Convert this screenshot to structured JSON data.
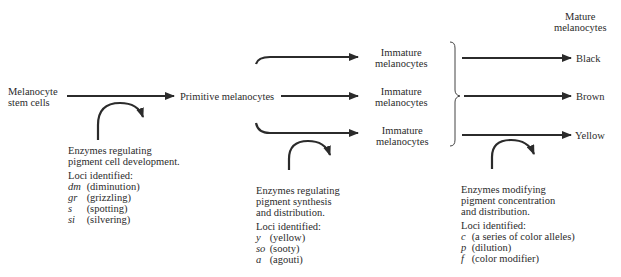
{
  "diagram": {
    "nodes": {
      "stem_cells": {
        "line1": "Melanocyte",
        "line2": "stem cells"
      },
      "primitive": "Primitive melanocytes",
      "immature": [
        {
          "line1": "Immature",
          "line2": "melanocytes"
        },
        {
          "line1": "Immature",
          "line2": "melanocytes"
        },
        {
          "line1": "Immature",
          "line2": "melanocytes"
        }
      ],
      "mature_header": {
        "line1": "Mature",
        "line2": "melanocytes"
      },
      "mature": [
        "Black",
        "Brown",
        "Yellow"
      ]
    },
    "annotations": [
      {
        "lines": [
          "Enzymes regulating",
          "pigment cell development."
        ],
        "loci_header": "Loci identified:",
        "loci": [
          {
            "symbol": "dm",
            "name": "(diminution)"
          },
          {
            "symbol": "gr",
            "name": "(grizzling)"
          },
          {
            "symbol": "s",
            "name": "(spotting)"
          },
          {
            "symbol": "si",
            "name": "(silvering)"
          }
        ]
      },
      {
        "lines": [
          "Enzymes regulating",
          "pigment synthesis",
          "and distribution."
        ],
        "loci_header": "Loci identified:",
        "loci": [
          {
            "symbol": "y",
            "name": "(yellow)"
          },
          {
            "symbol": "so",
            "name": "(sooty)"
          },
          {
            "symbol": "a",
            "name": "(agouti)"
          }
        ]
      },
      {
        "lines": [
          "Enzymes modifying",
          "pigment concentration",
          "and distribution."
        ],
        "loci_header": "Loci identified:",
        "loci": [
          {
            "symbol": "c",
            "name": "(a series of color alleles)"
          },
          {
            "symbol": "p",
            "name": "(dilution)"
          },
          {
            "symbol": "f",
            "name": "(color modifier)"
          }
        ]
      }
    ],
    "colors": {
      "ink": "#2b2b2b",
      "background": "#ffffff"
    }
  }
}
